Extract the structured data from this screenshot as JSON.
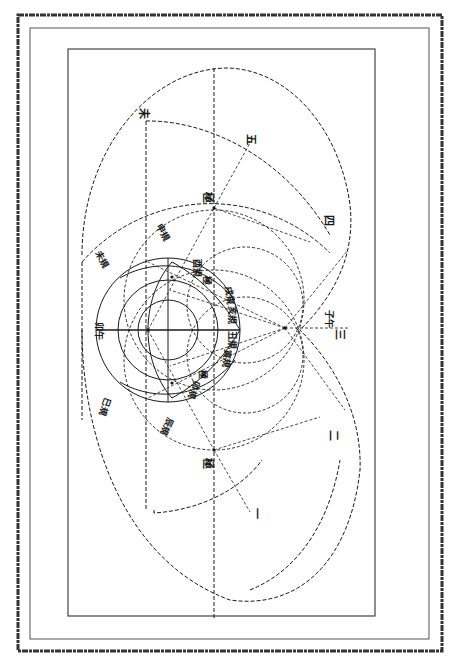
{
  "figure": {
    "type": "geometric construction diagram (rotated 90°, classical Chinese astronomical/geometric figure)",
    "frame": {
      "outer_border": "heavy rough double-line frame",
      "inner_box": "thin rectangle"
    },
    "colors": {
      "ink": "#1a1a1a",
      "paper": "#ffffff",
      "frame": "#333333"
    }
  },
  "labels": {
    "top_left_point": "未",
    "top_arc_mark": "五",
    "right_arc_mark": "四",
    "right_point": "子午",
    "right_mark_three": "三",
    "right_mark_two": "二",
    "bottom_mark_one": "一",
    "upper_axis_point": "極",
    "lower_axis_point": "極",
    "left_axis_label": "卯午",
    "upper_left_arc": "未規",
    "lower_left_arc": "巳規",
    "upper_mid_arc": "申規",
    "lower_mid_arc": "辰規",
    "inner_labels": [
      "酉規",
      "極",
      "戌規",
      "亥規",
      "丑規",
      "寅規",
      "極",
      "卯規"
    ]
  }
}
